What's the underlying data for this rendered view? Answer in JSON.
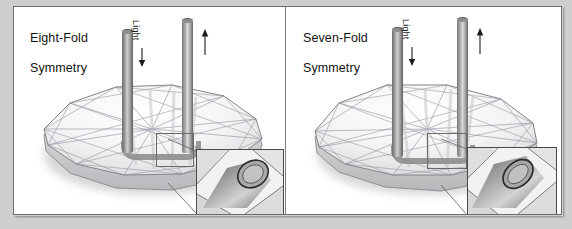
{
  "figure": {
    "background_color": "#cfcfcf",
    "frame_color": "#6d6d6d",
    "panel_background": "#ffffff",
    "divider_color": "#7d7d7d"
  },
  "panels": [
    {
      "id": "left",
      "title": "Eight-Fold\nSymmetry",
      "title_line1": "Eight-Fold",
      "title_line2": "Symmetry",
      "light_label": "Light",
      "light_arrow": "down-arrow-icon",
      "output_arrow": "up-arrow-icon",
      "symmetry_order": 8,
      "inset_label": "magnified-fiber-tip"
    },
    {
      "id": "right",
      "title": "Seven-Fold\nSymmetry",
      "title_line1": "Seven-Fold",
      "title_line2": "Symmetry",
      "light_label": "Light",
      "light_arrow": "down-arrow-icon",
      "output_arrow": "up-arrow-icon",
      "symmetry_order": 7,
      "inset_label": "magnified-fiber-tip"
    }
  ],
  "colors": {
    "rod_dark": "#5f5f5f",
    "rod_mid": "#8e8e8e",
    "rod_light": "#d9d9d9",
    "mesh_line": "#8d8d93",
    "inset_border": "#4a4a4a",
    "text": "#131313"
  }
}
